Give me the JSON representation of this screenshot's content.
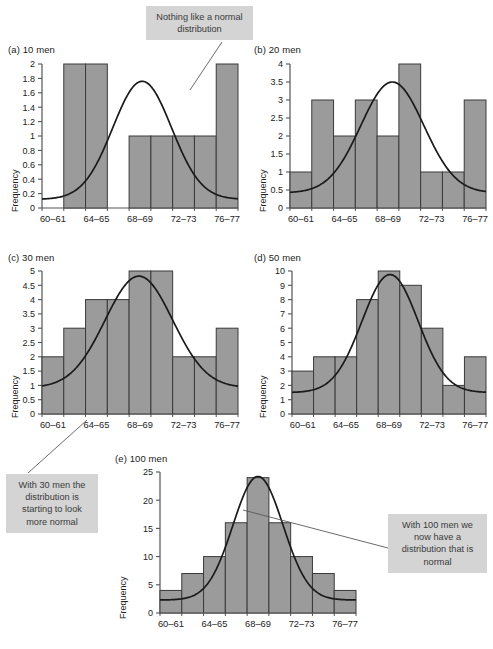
{
  "figure": {
    "xtick_labels": [
      "60–61",
      "64–65",
      "68–69",
      "72–73",
      "76–77"
    ],
    "ylabel": "Frequency",
    "bar_fill": "#9b9b9b",
    "bar_stroke": "#3a3a3a",
    "curve_color": "#1a1a1a",
    "callout_bg": "#d4d4d4"
  },
  "callouts": [
    {
      "id": "callout-a",
      "text": "Nothing like a normal distribution"
    },
    {
      "id": "callout-c",
      "text": "With 30 men the distribution is starting to look more normal"
    },
    {
      "id": "callout-e",
      "text": "With 100 men we now have a distribution that is normal"
    }
  ],
  "chart_data": [
    {
      "id": "panel-a",
      "type": "bar",
      "title": "(a) 10 men",
      "xlabel": "",
      "ylabel": "Frequency",
      "categories": [
        "60–61",
        "62–63",
        "64–65",
        "66–67",
        "68–69",
        "70–71",
        "72–73",
        "74–75",
        "76–77"
      ],
      "tick_labels": [
        "60–61",
        "64–65",
        "68–69",
        "72–73",
        "76–77"
      ],
      "values": [
        0,
        2,
        2,
        0,
        1,
        1,
        1,
        1,
        2
      ],
      "ylim": [
        0,
        2
      ],
      "yticks": [
        0,
        0.2,
        0.4,
        0.6,
        0.8,
        1,
        1.2,
        1.4,
        1.6,
        1.8,
        2
      ],
      "ytick_labels": [
        "0",
        "0.2",
        "0.4",
        "0.6",
        "0.8",
        "1",
        "1.2",
        "1.4",
        "1.6",
        "1.8",
        "2"
      ],
      "overlay": {
        "name": "normal curve",
        "peak": 1.76,
        "mean_bin": 4.6,
        "sd_bins": 1.35,
        "baseline": 0.12
      },
      "grid": false,
      "legend": "none"
    },
    {
      "id": "panel-b",
      "type": "bar",
      "title": "(b) 20 men",
      "xlabel": "",
      "ylabel": "Frequency",
      "categories": [
        "60–61",
        "62–63",
        "64–65",
        "66–67",
        "68–69",
        "70–71",
        "72–73",
        "74–75",
        "76–77"
      ],
      "tick_labels": [
        "60–61",
        "64–65",
        "68–69",
        "72–73",
        "76–77"
      ],
      "values": [
        1,
        3,
        2,
        3,
        2,
        4,
        1,
        1,
        3
      ],
      "ylim": [
        0,
        4
      ],
      "yticks": [
        0,
        0.5,
        1,
        1.5,
        2,
        2.5,
        3,
        3.5,
        4
      ],
      "ytick_labels": [
        "0",
        "0.5",
        "1",
        "1.5",
        "2",
        "2.5",
        "3",
        "3.5",
        "4"
      ],
      "overlay": {
        "name": "normal curve",
        "peak": 3.5,
        "mean_bin": 4.7,
        "sd_bins": 1.45,
        "baseline": 0.42
      },
      "grid": false,
      "legend": "none"
    },
    {
      "id": "panel-c",
      "type": "bar",
      "title": "(c) 30 men",
      "xlabel": "",
      "ylabel": "Frequency",
      "categories": [
        "60–61",
        "62–63",
        "64–65",
        "66–67",
        "68–69",
        "70–71",
        "72–73",
        "74–75",
        "76–77"
      ],
      "tick_labels": [
        "60–61",
        "64–65",
        "68–69",
        "72–73",
        "76–77"
      ],
      "values": [
        2,
        3,
        4,
        4,
        5,
        5,
        2,
        2,
        3
      ],
      "ylim": [
        0,
        5
      ],
      "yticks": [
        0,
        0.5,
        1,
        1.5,
        2,
        2.5,
        3,
        3.5,
        4,
        4.5,
        5
      ],
      "ytick_labels": [
        "0",
        "0.5",
        "1",
        "1.5",
        "2",
        "2.5",
        "3",
        "3.5",
        "4",
        "4.5",
        "5"
      ],
      "overlay": {
        "name": "normal curve",
        "peak": 4.82,
        "mean_bin": 4.45,
        "sd_bins": 1.55,
        "baseline": 0.92
      },
      "grid": false,
      "legend": "none"
    },
    {
      "id": "panel-d",
      "type": "bar",
      "title": "(d) 50 men",
      "xlabel": "",
      "ylabel": "Frequency",
      "categories": [
        "60–61",
        "62–63",
        "64–65",
        "66–67",
        "68–69",
        "70–71",
        "72–73",
        "74–75",
        "76–77"
      ],
      "tick_labels": [
        "60–61",
        "64–65",
        "68–69",
        "72–73",
        "76–77"
      ],
      "values": [
        3,
        4,
        4,
        8,
        10,
        9,
        6,
        2,
        4
      ],
      "ylim": [
        0,
        10
      ],
      "yticks": [
        0,
        1,
        2,
        3,
        4,
        5,
        6,
        7,
        8,
        9,
        10
      ],
      "ytick_labels": [
        "0",
        "1",
        "2",
        "3",
        "4",
        "5",
        "6",
        "7",
        "8",
        "9",
        "10"
      ],
      "overlay": {
        "name": "normal curve",
        "peak": 9.75,
        "mean_bin": 4.55,
        "sd_bins": 1.3,
        "baseline": 1.5
      },
      "grid": false,
      "legend": "none"
    },
    {
      "id": "panel-e",
      "type": "bar",
      "title": "(e) 100 men",
      "xlabel": "",
      "ylabel": "Frequency",
      "categories": [
        "60–61",
        "62–63",
        "64–65",
        "66–67",
        "68–69",
        "70–71",
        "72–73",
        "74–75",
        "76–77"
      ],
      "tick_labels": [
        "60–61",
        "64–65",
        "68–69",
        "72–73",
        "76–77"
      ],
      "values": [
        4,
        7,
        10,
        16,
        24,
        16,
        10,
        7,
        4
      ],
      "ylim": [
        0,
        25
      ],
      "yticks": [
        0,
        5,
        10,
        15,
        20,
        25
      ],
      "ytick_labels": [
        "0",
        "5",
        "10",
        "15",
        "20",
        "25"
      ],
      "overlay": {
        "name": "normal curve",
        "peak": 24.2,
        "mean_bin": 4.5,
        "sd_bins": 1.15,
        "baseline": 2.3
      },
      "grid": false,
      "legend": "none"
    }
  ]
}
